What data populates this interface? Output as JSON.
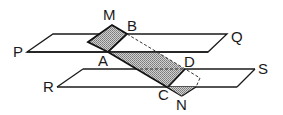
{
  "diagram": {
    "type": "geometry-planes",
    "labels": {
      "P": "P",
      "Q": "Q",
      "R": "R",
      "S": "S",
      "M": "M",
      "B": "B",
      "A": "A",
      "D": "D",
      "C": "C",
      "N": "N"
    },
    "colors": {
      "line": "#1a1a1a",
      "shade": "#a8a8a8",
      "background": "#ffffff"
    }
  }
}
